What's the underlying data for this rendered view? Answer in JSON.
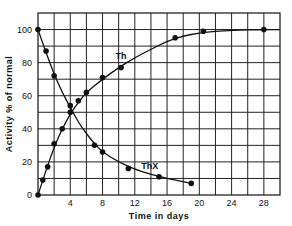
{
  "chart_data": {
    "type": "line",
    "title": "",
    "xlabel": "Time in days",
    "ylabel": "Activity % of normal",
    "xlim": [
      0,
      30
    ],
    "ylim": [
      0,
      110
    ],
    "xticks": [
      4,
      8,
      12,
      16,
      20,
      24,
      28
    ],
    "yticks": [
      0,
      20,
      40,
      60,
      80,
      100
    ],
    "grid": true,
    "grid_x_step": 2,
    "grid_y_step": 10,
    "legend": "inline labels",
    "series": [
      {
        "name": "Th",
        "label_pos": [
          9.6,
          82
        ],
        "points": [
          [
            0,
            0
          ],
          [
            0.6,
            9
          ],
          [
            1.2,
            17
          ],
          [
            2,
            31
          ],
          [
            3,
            40
          ],
          [
            4,
            50
          ],
          [
            5,
            57
          ],
          [
            6,
            62
          ],
          [
            8,
            71
          ],
          [
            10.3,
            77
          ],
          [
            17,
            95
          ],
          [
            20.5,
            99
          ],
          [
            28,
            100
          ]
        ],
        "curve": [
          [
            0,
            0
          ],
          [
            1,
            15
          ],
          [
            2,
            29
          ],
          [
            3,
            40
          ],
          [
            4,
            49
          ],
          [
            5,
            56
          ],
          [
            6,
            62
          ],
          [
            8,
            70
          ],
          [
            10,
            77
          ],
          [
            12,
            83
          ],
          [
            14,
            88
          ],
          [
            16,
            93
          ],
          [
            18,
            96
          ],
          [
            20,
            98
          ],
          [
            22,
            99
          ],
          [
            24,
            99.5
          ],
          [
            28,
            100
          ],
          [
            30,
            100
          ]
        ]
      },
      {
        "name": "ThX",
        "label_pos": [
          12.8,
          16
        ],
        "points": [
          [
            0,
            100
          ],
          [
            1,
            87
          ],
          [
            2,
            72
          ],
          [
            4,
            54
          ],
          [
            7,
            30
          ],
          [
            8,
            26
          ],
          [
            11.2,
            16
          ],
          [
            15,
            11
          ],
          [
            19,
            7
          ]
        ],
        "curve": [
          [
            0,
            100
          ],
          [
            1,
            86
          ],
          [
            2,
            73
          ],
          [
            3,
            62
          ],
          [
            4,
            53
          ],
          [
            5,
            44
          ],
          [
            6,
            37
          ],
          [
            7,
            31
          ],
          [
            8,
            26
          ],
          [
            10,
            20
          ],
          [
            12,
            15.5
          ],
          [
            14,
            12.5
          ],
          [
            16,
            10
          ],
          [
            19,
            7
          ]
        ]
      }
    ]
  }
}
